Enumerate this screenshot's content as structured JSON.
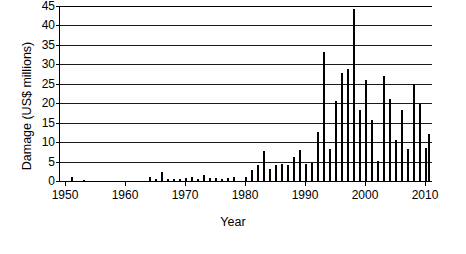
{
  "chart_data": {
    "type": "bar",
    "title": "",
    "xlabel": "Year",
    "ylabel": "Damage (US$ millions)",
    "xlim": [
      1949,
      2011
    ],
    "ylim": [
      0,
      45
    ],
    "ytick_values": [
      0,
      5,
      10,
      15,
      20,
      25,
      30,
      35,
      40,
      45
    ],
    "ytick_labels": [
      "0",
      "5",
      "10",
      "15",
      "20",
      "25",
      "30",
      "35",
      "40",
      "45"
    ],
    "xtick_values": [
      1950,
      1960,
      1970,
      1980,
      1990,
      2000,
      2010
    ],
    "xtick_labels": [
      "1950",
      "1960",
      "1970",
      "1980",
      "1990",
      "2000",
      "2010"
    ],
    "grid": "horizontal",
    "legend": "none",
    "bar_color": "#000000",
    "axis_color": "#000000",
    "background": "#ffffff",
    "x": [
      1950,
      1951,
      1952,
      1953,
      1954,
      1955,
      1956,
      1957,
      1958,
      1959,
      1960,
      1961,
      1962,
      1963,
      1964,
      1965,
      1966,
      1967,
      1968,
      1969,
      1970,
      1971,
      1972,
      1973,
      1974,
      1975,
      1976,
      1977,
      1978,
      1979,
      1980,
      1981,
      1982,
      1983,
      1984,
      1985,
      1986,
      1987,
      1988,
      1989,
      1990,
      1991,
      1992,
      1993,
      1994,
      1995,
      1996,
      1997,
      1998,
      1999,
      2000,
      2001,
      2002,
      2003,
      2004,
      2005,
      2006,
      2007,
      2008,
      2009,
      2010
    ],
    "values": [
      0.0,
      1.0,
      0.0,
      0.2,
      0.0,
      0.0,
      0.0,
      0.0,
      0.0,
      0.0,
      0.0,
      0.0,
      0.0,
      0.0,
      1.0,
      0.5,
      2.3,
      0.4,
      0.5,
      0.5,
      0.9,
      1.1,
      0.6,
      1.6,
      0.8,
      0.8,
      0.6,
      0.8,
      1.1,
      0.0,
      1.0,
      2.8,
      4.1,
      7.6,
      3.0,
      4.0,
      4.4,
      4.1,
      6.2,
      8.0,
      4.3,
      4.7,
      12.7,
      33.1,
      8.2,
      20.7,
      27.8,
      28.8,
      44.3,
      18.2,
      25.9,
      15.8,
      5.2,
      27.1,
      21.1,
      10.6,
      18.3,
      8.2,
      24.9,
      19.8,
      8.4
    ],
    "extra_points": [
      {
        "x": 2010.5,
        "value": 12.2
      }
    ],
    "peak": {
      "year": 1998,
      "value": 44.3
    },
    "series_note": "Annual damage in US$ millions, 1950-2010"
  },
  "axis": {
    "y_title": "Damage (US$ millions)",
    "x_title": "Year"
  }
}
